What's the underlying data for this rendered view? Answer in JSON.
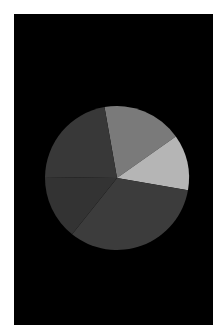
{
  "chart_data": {
    "type": "pie",
    "title": "",
    "legend": [],
    "start_angle_deg": -100,
    "direction": "clockwise",
    "slices": [
      {
        "label": "",
        "value": 18.0,
        "color": "#7a7a7a"
      },
      {
        "label": "",
        "value": 12.5,
        "color": "#b5b5b5"
      },
      {
        "label": "",
        "value": 33.0,
        "color": "#3c3c3c"
      },
      {
        "label": "",
        "value": 14.5,
        "color": "#333333"
      },
      {
        "label": "",
        "value": 22.0,
        "color": "#383838"
      }
    ],
    "background": "#000000"
  },
  "geometry": {
    "cx": 103,
    "cy": 164,
    "r": 72
  }
}
